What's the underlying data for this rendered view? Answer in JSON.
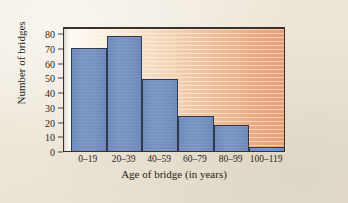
{
  "chart_data": {
    "type": "bar",
    "title": "",
    "subtitle": "",
    "xlabel": "Age of bridge (in years)",
    "ylabel": "Number of bridges",
    "categories": [
      "0–19",
      "20–39",
      "40–59",
      "60–79",
      "80–99",
      "100–119"
    ],
    "values": [
      70,
      78,
      49,
      24,
      18,
      3
    ],
    "series": [
      {
        "name": "Number of bridges",
        "values": [
          70,
          78,
          49,
          24,
          18,
          3
        ]
      }
    ],
    "ylim": [
      0,
      85
    ],
    "ytick_values": [
      0,
      10,
      20,
      30,
      40,
      50,
      60,
      70,
      80
    ],
    "ytick_labels": [
      "0",
      "10",
      "20",
      "30",
      "40",
      "50",
      "60",
      "70",
      "80"
    ],
    "grid": false,
    "legend": null,
    "legend_position": "none",
    "annotations": [],
    "colors": {
      "bar_fill": "#7691bf",
      "bar_edge": "#2e3a4e",
      "plot_background_left": "#fdfbf6",
      "plot_background_right": "#e89f76",
      "frame": "#3a3228",
      "page_background": "#ece5d6",
      "text": "#241f1a"
    }
  }
}
